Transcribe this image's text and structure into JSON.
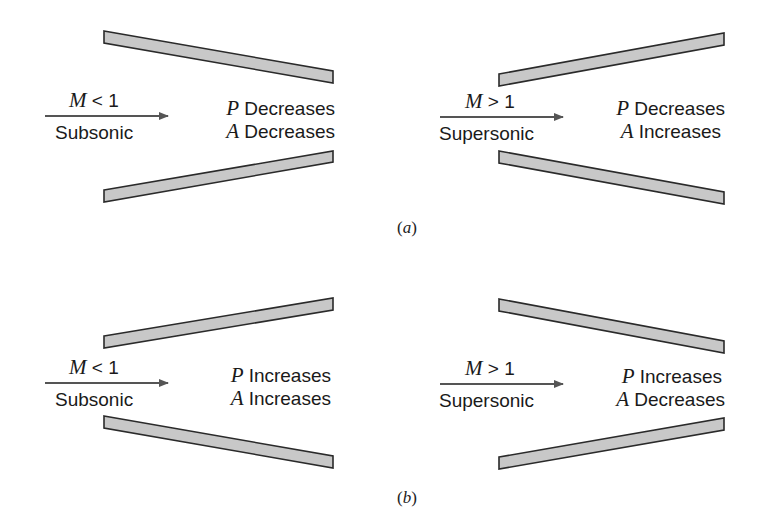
{
  "figure": {
    "colors": {
      "wall_fill": "#c8c8c8",
      "wall_stroke": "#2a2a2a",
      "arrow": "#555555",
      "text": "#1a1a1a"
    },
    "panels": [
      {
        "caption_letter": "a",
        "caption_open": "(",
        "caption_close": ")",
        "nozzles": [
          {
            "geometry": "converging",
            "mach_var": "M",
            "mach_rel": " < 1",
            "regime": "Subsonic",
            "p_var": "P",
            "p_effect": "Decreases",
            "a_var": "A",
            "a_effect": "Decreases"
          },
          {
            "geometry": "diverging",
            "mach_var": "M",
            "mach_rel": " > 1",
            "regime": "Supersonic",
            "p_var": "P",
            "p_effect": "Decreases",
            "a_var": "A",
            "a_effect": "Increases"
          }
        ]
      },
      {
        "caption_letter": "b",
        "caption_open": "(",
        "caption_close": ")",
        "nozzles": [
          {
            "geometry": "diverging",
            "mach_var": "M",
            "mach_rel": " < 1",
            "regime": "Subsonic",
            "p_var": "P",
            "p_effect": "Increases",
            "a_var": "A",
            "a_effect": "Increases"
          },
          {
            "geometry": "converging",
            "mach_var": "M",
            "mach_rel": " > 1",
            "regime": "Supersonic",
            "p_var": "P",
            "p_effect": "Increases",
            "a_var": "A",
            "a_effect": "Decreases"
          }
        ]
      }
    ]
  }
}
